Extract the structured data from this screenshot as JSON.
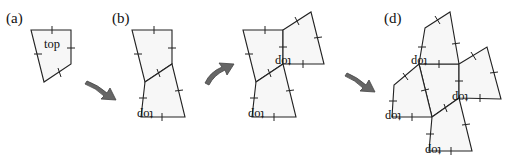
{
  "panels": [
    {
      "id": "a",
      "label": "(a)",
      "face_labels": [
        "top"
      ]
    },
    {
      "id": "b",
      "label": "(b)",
      "face_labels": [
        "top"
      ]
    },
    {
      "id": "c",
      "label": "(c)",
      "face_labels": [
        "top",
        "top"
      ]
    },
    {
      "id": "d",
      "label": "(d)",
      "face_labels": [
        "top",
        "top",
        "top",
        "top"
      ]
    }
  ],
  "arrows": [
    "curved-arrow-down-right",
    "curved-arrow-up-right",
    "curved-arrow-down-right"
  ],
  "colors": {
    "face_fill": "#f7f7f7",
    "stroke": "#222222",
    "arrow": "#666666"
  }
}
